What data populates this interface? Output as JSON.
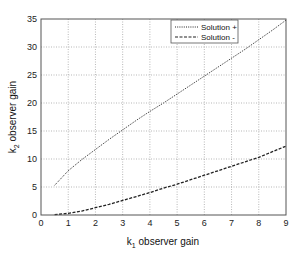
{
  "chart_data": {
    "type": "line",
    "title": "",
    "xlabel": "k1 observer gain",
    "xlabel_main": "k",
    "xlabel_sub": "1",
    "xlabel_rest": " observer gain",
    "ylabel": "k2 observer gain",
    "ylabel_main": "k",
    "ylabel_sub": "2",
    "ylabel_rest": " observer gain",
    "xlim": [
      0,
      9
    ],
    "ylim": [
      0,
      35
    ],
    "xticks": [
      0,
      1,
      2,
      3,
      4,
      5,
      6,
      7,
      8,
      9
    ],
    "yticks": [
      0,
      5,
      10,
      15,
      20,
      25,
      30,
      35
    ],
    "grid": true,
    "legend_position": "top-right",
    "series": [
      {
        "name": "Solution +",
        "style": "dotted",
        "x": [
          0.5,
          1,
          1.5,
          2,
          2.5,
          3,
          3.5,
          4,
          4.5,
          5,
          5.5,
          6,
          6.5,
          7,
          7.5,
          8,
          8.5,
          9
        ],
        "values": [
          5.3,
          7.9,
          9.9,
          11.7,
          13.5,
          15.2,
          16.9,
          18.5,
          20.0,
          21.6,
          23.2,
          24.8,
          26.4,
          28.0,
          29.6,
          31.3,
          33.0,
          34.8
        ]
      },
      {
        "name": "Solution -",
        "style": "dashed",
        "x": [
          0.5,
          1,
          1.5,
          2,
          2.5,
          3,
          3.5,
          4,
          4.5,
          5,
          5.5,
          6,
          6.5,
          7,
          7.5,
          8,
          8.5,
          9
        ],
        "values": [
          0.05,
          0.3,
          0.7,
          1.3,
          1.9,
          2.6,
          3.3,
          4.0,
          4.8,
          5.5,
          6.3,
          7.1,
          7.9,
          8.7,
          9.5,
          10.3,
          11.3,
          12.3
        ]
      }
    ]
  }
}
